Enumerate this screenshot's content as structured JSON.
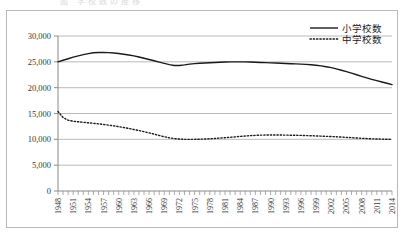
{
  "figure": {
    "top_caption": "図  学校数の推移",
    "frame_color": "#b9b9b9",
    "background": "#ffffff"
  },
  "chart_data": {
    "type": "line",
    "title": "",
    "xlabel": "",
    "ylabel": "",
    "ylim": [
      0,
      30000
    ],
    "xlim": [
      1948,
      2014
    ],
    "grid": true,
    "grid_axis": "y",
    "legend_position": "top-right",
    "y_ticks": [
      0,
      5000,
      10000,
      15000,
      20000,
      25000,
      30000
    ],
    "y_tick_labels": [
      "0",
      "5,000",
      "10,000",
      "15,000",
      "20,000",
      "25,000",
      "30,000"
    ],
    "x_tick_labels": [
      "1948",
      "1951",
      "1954",
      "1957",
      "1960",
      "1963",
      "1966",
      "1969",
      "1972",
      "1975",
      "1978",
      "1981",
      "1984",
      "1987",
      "1990",
      "1993",
      "1996",
      "1999",
      "2002",
      "2005",
      "2008",
      "2011",
      "2014"
    ],
    "x_tick_label_step": 3,
    "x_minor_tick_step": 1,
    "x": [
      1948,
      1949,
      1950,
      1951,
      1952,
      1953,
      1954,
      1955,
      1956,
      1957,
      1958,
      1959,
      1960,
      1961,
      1962,
      1963,
      1964,
      1965,
      1966,
      1967,
      1968,
      1969,
      1970,
      1971,
      1972,
      1973,
      1974,
      1975,
      1976,
      1977,
      1978,
      1979,
      1980,
      1981,
      1982,
      1983,
      1984,
      1985,
      1986,
      1987,
      1988,
      1989,
      1990,
      1991,
      1992,
      1993,
      1994,
      1995,
      1996,
      1997,
      1998,
      1999,
      2000,
      2001,
      2002,
      2003,
      2004,
      2005,
      2006,
      2007,
      2008,
      2009,
      2010,
      2011,
      2012,
      2013,
      2014
    ],
    "series": [
      {
        "name": "小学校数",
        "style": "solid",
        "color": "#1a1a1a",
        "width": 1.4,
        "values": [
          25000,
          25300,
          25600,
          25900,
          26150,
          26400,
          26600,
          26750,
          26800,
          26820,
          26780,
          26700,
          26600,
          26480,
          26330,
          26150,
          25930,
          25700,
          25450,
          25200,
          24950,
          24700,
          24450,
          24300,
          24280,
          24400,
          24550,
          24650,
          24720,
          24780,
          24830,
          24880,
          24920,
          24960,
          24990,
          25000,
          25000,
          24990,
          24960,
          24920,
          24880,
          24840,
          24800,
          24760,
          24720,
          24680,
          24640,
          24600,
          24560,
          24500,
          24430,
          24340,
          24220,
          24060,
          23870,
          23640,
          23380,
          23100,
          22800,
          22500,
          22200,
          21900,
          21620,
          21350,
          21100,
          20850,
          20600
        ]
      },
      {
        "name": "中学校数",
        "style": "dotted",
        "color": "#1a1a1a",
        "width": 1.4,
        "values": [
          15400,
          14200,
          13700,
          13500,
          13400,
          13300,
          13200,
          13100,
          13000,
          12880,
          12750,
          12600,
          12450,
          12280,
          12100,
          11900,
          11700,
          11480,
          11250,
          11000,
          10750,
          10500,
          10300,
          10150,
          10050,
          10000,
          9990,
          10000,
          10020,
          10060,
          10110,
          10170,
          10240,
          10320,
          10400,
          10480,
          10560,
          10640,
          10710,
          10770,
          10810,
          10830,
          10840,
          10840,
          10830,
          10820,
          10800,
          10780,
          10760,
          10730,
          10700,
          10660,
          10620,
          10580,
          10540,
          10490,
          10440,
          10380,
          10320,
          10260,
          10200,
          10150,
          10100,
          10070,
          10040,
          10010,
          9990
        ]
      }
    ]
  }
}
